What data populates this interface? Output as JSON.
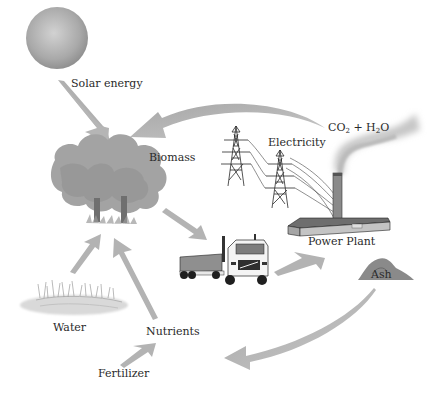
{
  "diagram": {
    "type": "biomass energy cycle",
    "labels": {
      "solar": "Solar energy",
      "biomass": "Biomass",
      "electricity": "Electricity",
      "emissions_co2": "CO",
      "emissions_co2_sub": "2",
      "emissions_plus": " + H",
      "emissions_h2o_sub": "2",
      "emissions_o": "O",
      "power_plant": "Power Plant",
      "ash": "Ash",
      "water": "Water",
      "nutrients": "Nutrients",
      "fertilizer": "Fertilizer"
    },
    "nodes": [
      {
        "id": "sun",
        "icon": "sun-icon"
      },
      {
        "id": "trees",
        "icon": "tree-icon"
      },
      {
        "id": "power-lines",
        "icon": "transmission-tower-icon"
      },
      {
        "id": "power-plant",
        "icon": "factory-icon"
      },
      {
        "id": "smoke",
        "icon": "smoke-plume-icon"
      },
      {
        "id": "truck",
        "icon": "truck-icon"
      },
      {
        "id": "ash-pile",
        "icon": "ash-pile-icon"
      },
      {
        "id": "pond",
        "icon": "water-marsh-icon"
      }
    ],
    "flows": [
      {
        "from": "Solar energy",
        "to": "Biomass"
      },
      {
        "from": "CO2 + H2O",
        "to": "Biomass"
      },
      {
        "from": "Biomass",
        "to": "Truck"
      },
      {
        "from": "Truck",
        "to": "Power Plant"
      },
      {
        "from": "Power Plant",
        "to": "Electricity"
      },
      {
        "from": "Ash",
        "to": "Nutrients"
      },
      {
        "from": "Water",
        "to": "Biomass"
      },
      {
        "from": "Nutrients",
        "to": "Biomass"
      },
      {
        "from": "Fertilizer",
        "to": "Nutrients"
      }
    ],
    "colors": {
      "arrow": "#b8b8b8",
      "sun": "#a8a8a8",
      "tree": "#9a9a9a",
      "text": "#2a2a2a",
      "smoke": "#c8c8c8"
    }
  }
}
